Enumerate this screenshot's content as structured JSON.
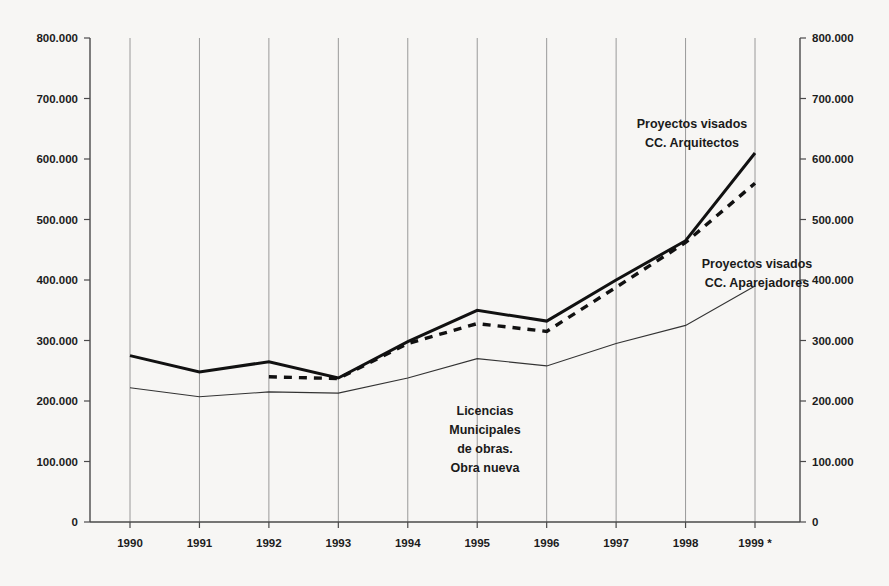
{
  "chart_data": {
    "type": "line",
    "title": "",
    "subtitle": "",
    "xlabel": "",
    "ylabel": "",
    "categories": [
      "1990",
      "1991",
      "1992",
      "1993",
      "1994",
      "1995",
      "1996",
      "1997",
      "1998",
      "1999 *"
    ],
    "ylim": [
      0,
      800000
    ],
    "y_ticks": [
      "0",
      "100.000",
      "200.000",
      "300.000",
      "400.000",
      "500.000",
      "600.000",
      "700.000",
      "800.000"
    ],
    "y_tick_values": [
      0,
      100000,
      200000,
      300000,
      400000,
      500000,
      600000,
      700000,
      800000
    ],
    "y_axis_right_ticks": [
      "0",
      "100.000",
      "200.000",
      "300.000",
      "400.000",
      "500.000",
      "600.000",
      "700.000",
      "800.000"
    ],
    "grid": "vertical",
    "legend": "annotations-inline",
    "series": [
      {
        "name": "Proyectos visados CC. Arquitectos",
        "style": "thick-solid",
        "color": "#111111",
        "values": [
          275000,
          248000,
          265000,
          238000,
          298000,
          350000,
          332000,
          400000,
          465000,
          610000
        ]
      },
      {
        "name": "Proyectos visados CC. Aparejadores",
        "style": "dashed",
        "color": "#111111",
        "values": [
          null,
          null,
          240000,
          237000,
          295000,
          328000,
          315000,
          388000,
          462000,
          560000
        ]
      },
      {
        "name": "Licencias Municipales de obras. Obra nueva",
        "style": "thin-solid",
        "color": "#333333",
        "values": [
          222000,
          207000,
          215000,
          213000,
          238000,
          270000,
          258000,
          295000,
          325000,
          390000
        ]
      }
    ],
    "annotations": [
      {
        "id": "annot-arquitectos",
        "lines": [
          "Proyectos visados",
          "CC. Arquitectos"
        ],
        "x": 692,
        "y": 128,
        "anchor": "middle"
      },
      {
        "id": "annot-aparejadores",
        "lines": [
          "Proyectos visados",
          "CC. Aparejadores"
        ],
        "x": 757,
        "y": 268,
        "anchor": "middle"
      },
      {
        "id": "annot-licencias",
        "lines": [
          "Licencias",
          "Municipales",
          "de obras.",
          "Obra nueva"
        ],
        "x": 485,
        "y": 415,
        "anchor": "middle"
      }
    ],
    "footnote_marker": "*"
  },
  "colors": {
    "background": "#f7f6f4",
    "axis": "#4a4a4a",
    "gridline": "#8e8e8e",
    "series_primary": "#111111",
    "series_secondary": "#333333"
  }
}
